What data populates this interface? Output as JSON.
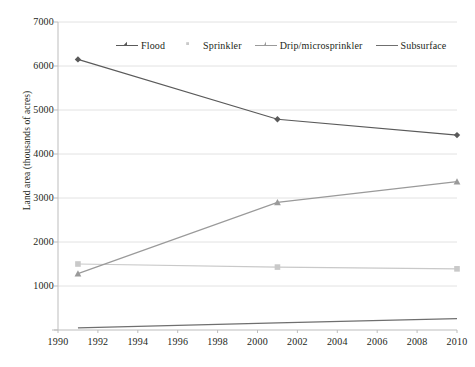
{
  "chart_data": {
    "type": "line",
    "title": "",
    "xlabel": "",
    "ylabel": "Land area (thousands of acres)",
    "xlim": [
      1990,
      2010
    ],
    "ylim": [
      0,
      7000
    ],
    "xticks": [
      1990,
      1992,
      1994,
      1996,
      1998,
      2000,
      2002,
      2004,
      2006,
      2008,
      2010
    ],
    "yticks": [
      0,
      1000,
      2000,
      3000,
      4000,
      5000,
      6000,
      7000
    ],
    "ytick_labels": [
      "",
      "1000",
      "2000",
      "3000",
      "4000",
      "5000",
      "6000",
      "7000"
    ],
    "grid": "horizontal",
    "legend_position": "top-inside",
    "x": [
      1991,
      2001,
      2010
    ],
    "series": [
      {
        "name": "Flood",
        "color": "#5a5a5a",
        "marker": "diamond",
        "values": [
          6150,
          4790,
          4430
        ]
      },
      {
        "name": "Sprinkler",
        "color": "#c9c9c9",
        "marker": "square",
        "values": [
          1500,
          1430,
          1390
        ]
      },
      {
        "name": "Drip/microsprinkler",
        "color": "#9a9a9a",
        "marker": "triangle",
        "values": [
          1280,
          2900,
          3370
        ]
      },
      {
        "name": "Subsurface",
        "color": "#6f6f6f",
        "marker": "none",
        "values": [
          50,
          160,
          260
        ]
      }
    ]
  },
  "legend": {
    "items": [
      {
        "label": "Flood"
      },
      {
        "label": "Sprinkler"
      },
      {
        "label": "Drip/microsprinkler"
      },
      {
        "label": "Subsurface"
      }
    ]
  }
}
